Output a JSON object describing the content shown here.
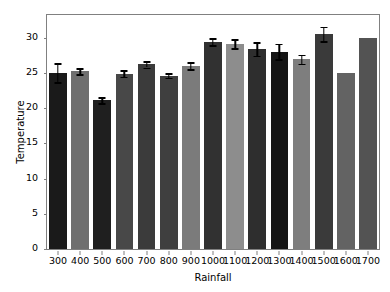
{
  "chart_data": {
    "type": "bar",
    "title": "",
    "xlabel": "Rainfall",
    "ylabel": "Temperature",
    "categories": [
      "300",
      "400",
      "500",
      "600",
      "700",
      "800",
      "900",
      "1000",
      "1100",
      "1200",
      "1300",
      "1400",
      "1500",
      "1600",
      "1700"
    ],
    "values": [
      25.0,
      25.2,
      21.1,
      24.9,
      26.2,
      24.6,
      26.0,
      29.4,
      29.1,
      28.4,
      28.0,
      26.9,
      30.5,
      25.0,
      30.0
    ],
    "errors": [
      1.35,
      0.42,
      0.45,
      0.45,
      0.45,
      0.35,
      0.5,
      0.5,
      0.65,
      0.95,
      1.1,
      0.65,
      1.05,
      0.0,
      0.0
    ],
    "bar_colors": [
      "#1a1a1a",
      "#6f6f6f",
      "#1f1f1f",
      "#484848",
      "#3b3b3b",
      "#3f3f3f",
      "#7b7b7b",
      "#313131",
      "#8d8d8d",
      "#2e2e2e",
      "#151515",
      "#7e7e7e",
      "#3a3a3a",
      "#636363",
      "#535353"
    ],
    "yticks": [
      0,
      5,
      10,
      15,
      20,
      25,
      30
    ],
    "ytick_labels": [
      "0",
      "5",
      "10",
      "15",
      "20",
      "25",
      "30"
    ],
    "ylim": [
      0,
      33.2
    ],
    "xlim": [
      -0.5,
      14.5
    ],
    "grid": false,
    "legend": null,
    "error_bar_color": "#000000",
    "axes_edge_color": "#808080",
    "background_color": "#ffffff"
  }
}
